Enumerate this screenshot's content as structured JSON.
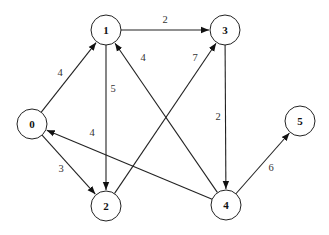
{
  "graph": {
    "type": "directed-weighted",
    "nodes": [
      {
        "id": "0",
        "label": "0",
        "x": 32,
        "y": 124
      },
      {
        "id": "1",
        "label": "1",
        "x": 106,
        "y": 30
      },
      {
        "id": "2",
        "label": "2",
        "x": 106,
        "y": 206
      },
      {
        "id": "3",
        "label": "3",
        "x": 225,
        "y": 30
      },
      {
        "id": "4",
        "label": "4",
        "x": 226,
        "y": 205
      },
      {
        "id": "5",
        "label": "5",
        "x": 300,
        "y": 121
      }
    ],
    "edges": [
      {
        "from": "0",
        "to": "1",
        "weight": "4",
        "lx": 60,
        "ly": 72
      },
      {
        "from": "0",
        "to": "2",
        "weight": "3",
        "lx": 61,
        "ly": 168
      },
      {
        "from": "1",
        "to": "3",
        "weight": "2",
        "lx": 165,
        "ly": 19
      },
      {
        "from": "1",
        "to": "2",
        "weight": "5",
        "lx": 113,
        "ly": 88
      },
      {
        "from": "2",
        "to": "3",
        "weight": "7",
        "lx": 195,
        "ly": 57
      },
      {
        "from": "3",
        "to": "4",
        "weight": "2",
        "lx": 218,
        "ly": 116
      },
      {
        "from": "4",
        "to": "1",
        "weight": "4",
        "lx": 143,
        "ly": 57
      },
      {
        "from": "4",
        "to": "0",
        "weight": "4",
        "lx": 92,
        "ly": 132
      },
      {
        "from": "4",
        "to": "5",
        "weight": "6",
        "lx": 271,
        "ly": 167
      }
    ]
  }
}
